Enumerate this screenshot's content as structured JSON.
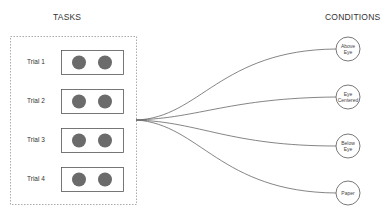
{
  "headings": {
    "tasks": "TASKS",
    "conditions": "CONDITIONS"
  },
  "trials": [
    {
      "label": "Trial 1"
    },
    {
      "label": "Trial 2"
    },
    {
      "label": "Trial 3"
    },
    {
      "label": "Trial 4"
    }
  ],
  "conditions": [
    {
      "line1": "Above",
      "line2": "Eye"
    },
    {
      "line1": "Eye",
      "line2": "Centered"
    },
    {
      "line1": "Below",
      "line2": "Eye"
    },
    {
      "line1": "Paper",
      "line2": ""
    }
  ],
  "colors": {
    "dot": "#6b6b6b",
    "stroke": "#555555",
    "dashed": "#aaaaaa"
  }
}
